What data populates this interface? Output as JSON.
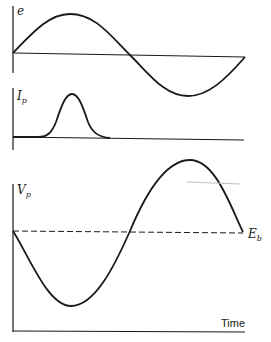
{
  "diagram": {
    "panels": [
      {
        "id": "grid-voltage",
        "label": "e",
        "curve": "sine"
      },
      {
        "id": "plate-current",
        "label": "I",
        "label_sub": "p",
        "curve": "pulse"
      },
      {
        "id": "plate-voltage",
        "label": "V",
        "label_sub": "p",
        "curve": "inverted-sine",
        "reference_label": "E",
        "reference_sub": "b"
      }
    ],
    "x_axis_label": "Time",
    "colors": {
      "stroke": "#1a1a1a",
      "background": "#ffffff"
    }
  }
}
